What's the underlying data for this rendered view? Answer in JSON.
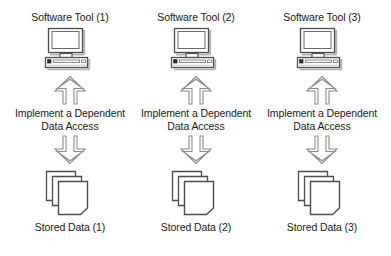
{
  "diagram": {
    "type": "architecture-block-diagram",
    "background_color": "#ffffff",
    "text_color": "#1a1a1a",
    "outline_color": "#4d4d4d",
    "icon_fill_color": "#ffffff",
    "icon_shadow_color": "#b3b3b3",
    "columns": [
      {
        "tool_label": "Software Tool (1)",
        "tool_icon": "desktop-computer-icon",
        "arrow_up_icon": "hollow-arrow-up",
        "access_label_line1": "Implement a Dependent",
        "access_label_line2": "Data Access",
        "arrow_down_icon": "hollow-arrow-down",
        "data_icon": "stacked-documents-icon",
        "data_label": "Stored Data (1)"
      },
      {
        "tool_label": "Software Tool (2)",
        "tool_icon": "desktop-computer-icon",
        "arrow_up_icon": "hollow-arrow-up",
        "access_label_line1": "Implement a Dependent",
        "access_label_line2": "Data Access",
        "arrow_down_icon": "hollow-arrow-down",
        "data_icon": "stacked-documents-icon",
        "data_label": "Stored Data (2)"
      },
      {
        "tool_label": "Software Tool (3)",
        "tool_icon": "desktop-computer-icon",
        "arrow_up_icon": "hollow-arrow-up",
        "access_label_line1": "Implement a Dependent",
        "access_label_line2": "Data Access",
        "arrow_down_icon": "hollow-arrow-down",
        "data_icon": "stacked-documents-icon",
        "data_label": "Stored Data (3)"
      }
    ]
  }
}
